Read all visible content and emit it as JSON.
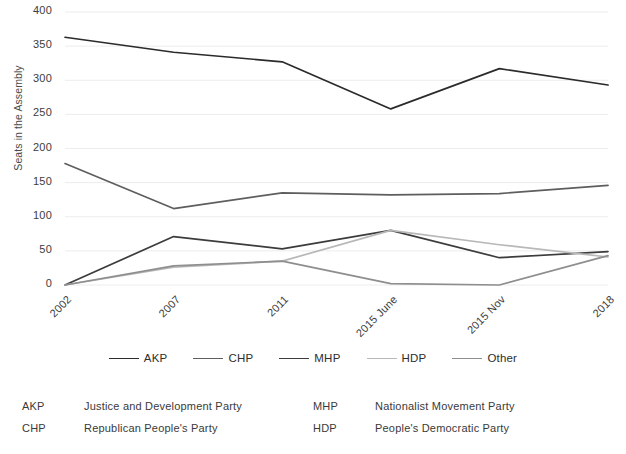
{
  "chart_data": {
    "type": "line",
    "title": "",
    "xlabel": "",
    "ylabel": "Seats in the Assembly",
    "categories": [
      "2002",
      "2007",
      "2011",
      "2015 June",
      "2015 Nov",
      "2018"
    ],
    "ylim": [
      0,
      400
    ],
    "yticks": [
      0,
      50,
      100,
      150,
      200,
      250,
      300,
      350,
      400
    ],
    "grid": true,
    "legend_position": "bottom",
    "series": [
      {
        "name": "AKP",
        "color": "#2b2b2b",
        "values": [
          363,
          341,
          327,
          258,
          317,
          293
        ]
      },
      {
        "name": "CHP",
        "color": "#5e5e5e",
        "values": [
          178,
          112,
          135,
          132,
          134,
          146
        ]
      },
      {
        "name": "MHP",
        "color": "#3c3c3c",
        "values": [
          0,
          71,
          53,
          80,
          40,
          49
        ]
      },
      {
        "name": "HDP",
        "color": "#b8b8b8",
        "values": [
          0,
          26,
          35,
          80,
          59,
          41
        ]
      },
      {
        "name": "Other",
        "color": "#8e8e8e",
        "values": [
          0,
          28,
          35,
          2,
          0,
          43
        ]
      }
    ]
  },
  "legend": {
    "items": [
      {
        "label": "AKP",
        "color": "#2b2b2b"
      },
      {
        "label": "CHP",
        "color": "#5e5e5e"
      },
      {
        "label": "MHP",
        "color": "#3c3c3c"
      },
      {
        "label": "HDP",
        "color": "#b8b8b8"
      },
      {
        "label": "Other",
        "color": "#8e8e8e"
      }
    ]
  },
  "footnotes": [
    {
      "abbr": "AKP",
      "full": "Justice and Development Party"
    },
    {
      "abbr": "MHP",
      "full": "Nationalist Movement Party"
    },
    {
      "abbr": "CHP",
      "full": "Republican People's Party"
    },
    {
      "abbr": "HDP",
      "full": "People's Democratic Party"
    }
  ]
}
